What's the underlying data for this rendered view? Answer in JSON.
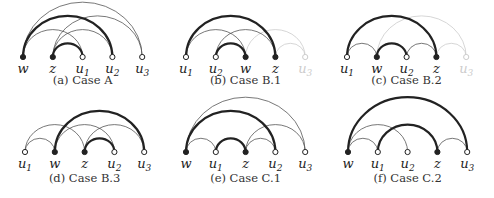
{
  "colors": {
    "ink": "#222222",
    "thin": "#555555",
    "faded": "#cccccc"
  },
  "panels": [
    {
      "id": "a",
      "caption": "(a) Case A",
      "nodes": [
        {
          "name": "w",
          "sub": "",
          "filled": true
        },
        {
          "name": "z",
          "sub": "",
          "filled": true
        },
        {
          "name": "u",
          "sub": "1",
          "filled": false
        },
        {
          "name": "u",
          "sub": "2",
          "filled": false
        },
        {
          "name": "u",
          "sub": "3",
          "filled": false
        }
      ],
      "edges": [
        {
          "from": 0,
          "to": 4,
          "style": "thin"
        },
        {
          "from": 0,
          "to": 3,
          "style": "thick"
        },
        {
          "from": 0,
          "to": 2,
          "style": "thin"
        },
        {
          "from": 1,
          "to": 2,
          "style": "thick"
        },
        {
          "from": 1,
          "to": 3,
          "style": "thin"
        },
        {
          "from": 1,
          "to": 4,
          "style": "thin"
        }
      ]
    },
    {
      "id": "b1",
      "caption": "(b) Case B.1",
      "nodes": [
        {
          "name": "u",
          "sub": "1",
          "filled": false
        },
        {
          "name": "u",
          "sub": "2",
          "filled": false
        },
        {
          "name": "w",
          "sub": "",
          "filled": true
        },
        {
          "name": "z",
          "sub": "",
          "filled": true
        },
        {
          "name": "u",
          "sub": "3",
          "filled": false,
          "faded": true
        }
      ],
      "edges": [
        {
          "from": 0,
          "to": 3,
          "style": "thick"
        },
        {
          "from": 0,
          "to": 2,
          "style": "thin"
        },
        {
          "from": 1,
          "to": 2,
          "style": "thick"
        },
        {
          "from": 1,
          "to": 3,
          "style": "thin"
        },
        {
          "from": 2,
          "to": 4,
          "style": "faded"
        },
        {
          "from": 3,
          "to": 4,
          "style": "faded"
        }
      ]
    },
    {
      "id": "b2",
      "caption": "(c) Case B.2",
      "nodes": [
        {
          "name": "u",
          "sub": "1",
          "filled": false
        },
        {
          "name": "w",
          "sub": "",
          "filled": true
        },
        {
          "name": "u",
          "sub": "2",
          "filled": false
        },
        {
          "name": "z",
          "sub": "",
          "filled": true
        },
        {
          "name": "u",
          "sub": "3",
          "filled": false,
          "faded": true
        }
      ],
      "edges": [
        {
          "from": 0,
          "to": 3,
          "style": "thick"
        },
        {
          "from": 0,
          "to": 1,
          "style": "thin"
        },
        {
          "from": 1,
          "to": 2,
          "style": "thick"
        },
        {
          "from": 2,
          "to": 3,
          "style": "thin"
        },
        {
          "from": 1,
          "to": 4,
          "style": "faded"
        },
        {
          "from": 3,
          "to": 4,
          "style": "faded"
        }
      ]
    },
    {
      "id": "b3",
      "caption": "(d) Case B.3",
      "nodes": [
        {
          "name": "u",
          "sub": "1",
          "filled": false
        },
        {
          "name": "w",
          "sub": "",
          "filled": true
        },
        {
          "name": "z",
          "sub": "",
          "filled": true
        },
        {
          "name": "u",
          "sub": "2",
          "filled": false
        },
        {
          "name": "u",
          "sub": "3",
          "filled": false
        }
      ],
      "edges": [
        {
          "from": 1,
          "to": 4,
          "style": "thick"
        },
        {
          "from": 0,
          "to": 1,
          "style": "thin"
        },
        {
          "from": 0,
          "to": 2,
          "style": "thin"
        },
        {
          "from": 1,
          "to": 3,
          "style": "thin"
        },
        {
          "from": 2,
          "to": 3,
          "style": "thick"
        },
        {
          "from": 2,
          "to": 4,
          "style": "thin"
        }
      ]
    },
    {
      "id": "c1",
      "caption": "(e) Case C.1",
      "nodes": [
        {
          "name": "w",
          "sub": "",
          "filled": true
        },
        {
          "name": "u",
          "sub": "1",
          "filled": false
        },
        {
          "name": "z",
          "sub": "",
          "filled": true
        },
        {
          "name": "u",
          "sub": "2",
          "filled": false
        },
        {
          "name": "u",
          "sub": "3",
          "filled": false
        }
      ],
      "edges": [
        {
          "from": 0,
          "to": 4,
          "style": "thin"
        },
        {
          "from": 0,
          "to": 3,
          "style": "thick"
        },
        {
          "from": 0,
          "to": 1,
          "style": "thin"
        },
        {
          "from": 1,
          "to": 2,
          "style": "thick"
        },
        {
          "from": 2,
          "to": 3,
          "style": "thin"
        },
        {
          "from": 2,
          "to": 4,
          "style": "thin"
        }
      ]
    },
    {
      "id": "c2",
      "caption": "(f) Case C.2",
      "nodes": [
        {
          "name": "w",
          "sub": "",
          "filled": true
        },
        {
          "name": "u",
          "sub": "1",
          "filled": false
        },
        {
          "name": "u",
          "sub": "2",
          "filled": false
        },
        {
          "name": "z",
          "sub": "",
          "filled": true
        },
        {
          "name": "u",
          "sub": "3",
          "filled": false
        }
      ],
      "edges": [
        {
          "from": 0,
          "to": 4,
          "style": "thick"
        },
        {
          "from": 0,
          "to": 1,
          "style": "thin"
        },
        {
          "from": 0,
          "to": 2,
          "style": "thin"
        },
        {
          "from": 1,
          "to": 3,
          "style": "thick"
        },
        {
          "from": 3,
          "to": 4,
          "style": "thin"
        }
      ]
    }
  ]
}
